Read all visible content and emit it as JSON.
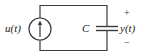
{
  "diagram": {
    "type": "circuit",
    "components": [
      {
        "id": "source",
        "kind": "current-source",
        "label": "u(t)",
        "direction": "up"
      },
      {
        "id": "capacitor",
        "kind": "capacitor",
        "label": "C"
      }
    ],
    "output": {
      "label": "y(t)",
      "plus": "+",
      "minus": "−"
    },
    "colors": {
      "line": "#3a3a3a",
      "text": "#222222",
      "background": "#ffffff"
    }
  }
}
